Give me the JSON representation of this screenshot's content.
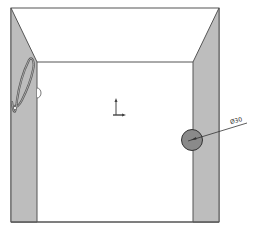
{
  "drawing": {
    "type": "cad-section-view",
    "background": "#ffffff",
    "colors": {
      "wall_fill": "#bdbdbd",
      "line": "#555555",
      "hole_fill": "#8a8a8a",
      "cable": "#555555"
    },
    "dimension": {
      "label": "Ø30"
    },
    "annotations": {
      "origin_triad": "origin-axes",
      "cable": "wavy-hose"
    }
  }
}
